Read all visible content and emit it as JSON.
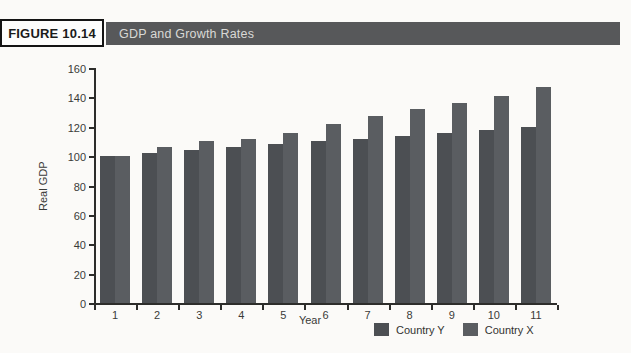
{
  "figure": {
    "label": "FIGURE 10.14",
    "title": "GDP and Growth Rates"
  },
  "chart_data": {
    "type": "bar",
    "title": "GDP and Growth Rates",
    "xlabel": "Year",
    "ylabel": "Real GDP",
    "categories": [
      "1",
      "2",
      "3",
      "4",
      "5",
      "6",
      "7",
      "8",
      "9",
      "10",
      "11"
    ],
    "series": [
      {
        "name": "Country Y",
        "color": "#4c4f53",
        "values": [
          100,
          102,
          104,
          106,
          108,
          110,
          112,
          114,
          116,
          118,
          120
        ]
      },
      {
        "name": "Country X",
        "color": "#5a5d61",
        "values": [
          100,
          106,
          110,
          112,
          116,
          122,
          127,
          132,
          136,
          141,
          147
        ]
      }
    ],
    "ylim": [
      0,
      160
    ],
    "ytick_step": 20,
    "grid": false,
    "legend_position": "bottom-right"
  },
  "colors": {
    "page_bg": "#fbfaf8",
    "banner_bg": "#57585a",
    "banner_text": "#d9d9d6",
    "label_box_border": "#141414",
    "axis": "#2d2d2b",
    "tick_text": "#3a3a38"
  }
}
